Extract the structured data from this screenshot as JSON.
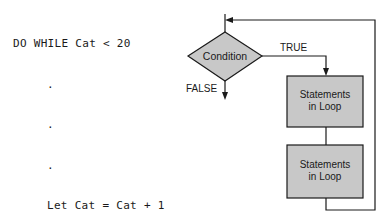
{
  "code": {
    "lines": [
      {
        "text": "DO WHILE Cat < 20",
        "indent": false
      },
      {
        "text": ".",
        "indent": true
      },
      {
        "text": ".",
        "indent": true
      },
      {
        "text": ".",
        "indent": true
      },
      {
        "text": "Let Cat = Cat + 1",
        "indent": true
      },
      {
        "text": "LOOP",
        "indent": false
      }
    ]
  },
  "flowchart": {
    "decision": {
      "label": "Condition"
    },
    "true_label": "TRUE",
    "false_label": "FALSE",
    "boxes": [
      {
        "line1": "Statements",
        "line2": "in Loop"
      },
      {
        "line1": "Statements",
        "line2": "in Loop"
      }
    ],
    "colors": {
      "fill": "#c8c8c8",
      "stroke": "#1a1a1a"
    }
  }
}
